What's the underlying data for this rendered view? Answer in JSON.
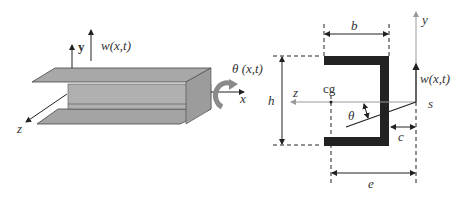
{
  "left_figure": {
    "title": "3D channel beam",
    "labels": {
      "y_axis": "y",
      "deflection": "w(x,t)",
      "rotation": "θ (x,t)",
      "x_axis": "x",
      "z_axis": "z"
    }
  },
  "right_figure": {
    "title": "Channel cross-section",
    "labels": {
      "flange_width": "b",
      "height": "h",
      "centroid": "cg",
      "z_axis": "z",
      "y_axis": "y",
      "deflection": "w(x,t)",
      "shear_center": "s",
      "angle": "θ",
      "web_offset": "c",
      "shear_center_offset": "e"
    }
  },
  "colors": {
    "beam_fill": "#a8a8a8",
    "section_fill": "#222222",
    "axis_gray": "#9a9a9a",
    "line": "#222222"
  }
}
